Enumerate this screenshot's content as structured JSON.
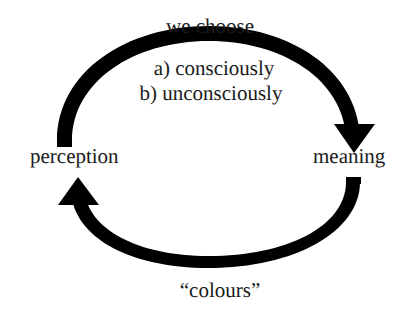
{
  "diagram": {
    "type": "cycle",
    "background_color": "#ffffff",
    "stroke_color": "#000000",
    "text_color": "#1a1a1a",
    "nodes": [
      {
        "id": "perception",
        "label": "perception",
        "position": "left"
      },
      {
        "id": "meaning",
        "label": "meaning",
        "position": "right"
      }
    ],
    "arrows": [
      {
        "id": "top-arc",
        "from": "perception",
        "to": "meaning",
        "direction": "clockwise",
        "head": "down-triangle",
        "labels": [
          "we choose",
          "a) consciously",
          "b) unconsciously"
        ]
      },
      {
        "id": "bottom-arc",
        "from": "meaning",
        "to": "perception",
        "direction": "counter-clockwise",
        "head": "up-triangle",
        "labels": [
          "“colours”"
        ]
      }
    ],
    "labels": {
      "top_heading": "we choose",
      "option_a": "a) consciously",
      "option_b": "b) unconsciously",
      "left_node": "perception",
      "right_node": "meaning",
      "bottom_caption": "“colours”"
    }
  }
}
